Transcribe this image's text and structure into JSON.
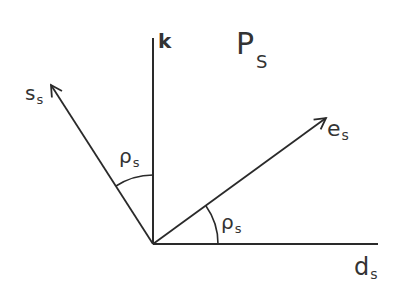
{
  "diagram": {
    "title_main": "P",
    "title_sub": "S",
    "axis_k": "k",
    "vector_s": {
      "main": "s",
      "sub": "s"
    },
    "vector_e": {
      "main": "e",
      "sub": "s"
    },
    "axis_d": {
      "main": "d",
      "sub": "s"
    },
    "angle_upper": {
      "main": "ρ",
      "sub": "s"
    },
    "angle_lower": {
      "main": "ρ",
      "sub": "s"
    },
    "line_color": "#2a2a2a"
  }
}
